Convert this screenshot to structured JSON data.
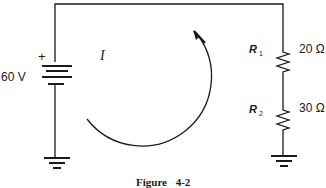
{
  "diagram": {
    "type": "series-circuit",
    "caption": "Figure 4-2",
    "source": {
      "label": "60 V",
      "polarity_mark": "+"
    },
    "current": {
      "label": "I",
      "direction": "clockwise"
    },
    "resistors": [
      {
        "name": "R",
        "subscript": "1",
        "value": "20 Ω"
      },
      {
        "name": "R",
        "subscript": "2",
        "value": "30 Ω"
      }
    ],
    "grounds": [
      "left-ground",
      "right-ground"
    ],
    "colors": {
      "ink": "#1a1a1a",
      "background": "#ffffff"
    }
  }
}
